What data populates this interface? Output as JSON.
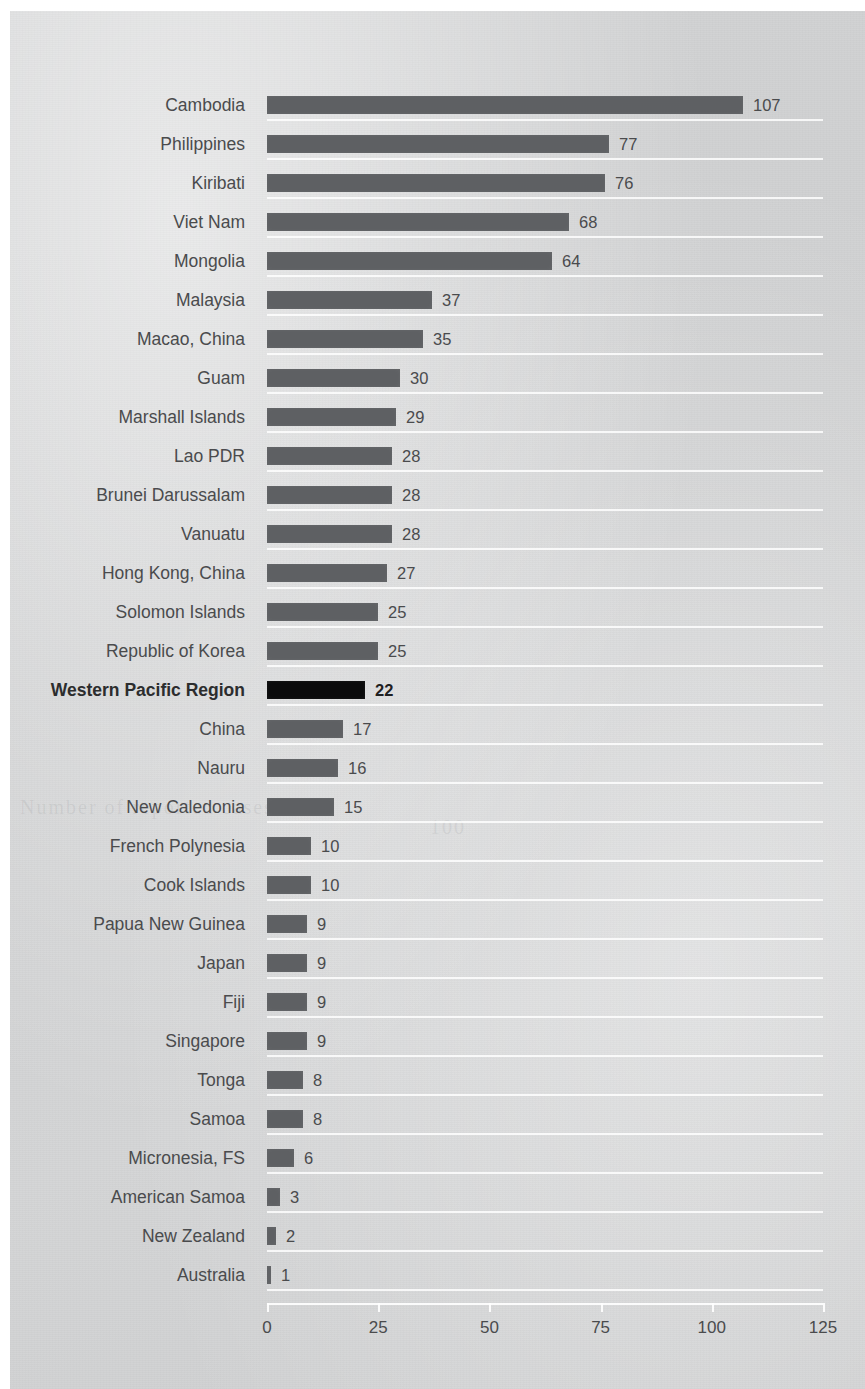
{
  "chart_data": {
    "type": "bar",
    "orientation": "horizontal",
    "title": "",
    "xlabel": "",
    "ylabel": "",
    "xlim": [
      0,
      125
    ],
    "xticks": [
      "0",
      "25",
      "50",
      "75",
      "100",
      "125"
    ],
    "grid": true,
    "legend": "none",
    "highlight_category": "Western Pacific Region",
    "colors": {
      "bar": "#5e6063",
      "highlight_bar": "#0b0b0c",
      "gridline": "#ffffff",
      "text": "#4a4b4d",
      "page_background": "#d2d3d4"
    },
    "categories": [
      "Cambodia",
      "Philippines",
      "Kiribati",
      "Viet Nam",
      "Mongolia",
      "Malaysia",
      "Macao, China",
      "Guam",
      "Marshall Islands",
      "Lao PDR",
      "Brunei Darussalam",
      "Vanuatu",
      "Hong Kong, China",
      "Solomon Islands",
      "Republic of Korea",
      "Western Pacific Region",
      "China",
      "Nauru",
      "New Caledonia",
      "French Polynesia",
      "Cook Islands",
      "Papua New Guinea",
      "Japan",
      "Fiji",
      "Singapore",
      "Tonga",
      "Samoa",
      "Micronesia, FS",
      "American Samoa",
      "New Zealand",
      "Australia"
    ],
    "values": [
      107,
      77,
      76,
      68,
      64,
      37,
      35,
      30,
      29,
      28,
      28,
      28,
      27,
      25,
      25,
      22,
      17,
      16,
      15,
      10,
      10,
      9,
      9,
      9,
      9,
      8,
      8,
      6,
      3,
      2,
      1
    ],
    "value_labels": [
      "107",
      "77",
      "76",
      "68",
      "64",
      "37",
      "35",
      "30",
      "29",
      "28",
      "28",
      "28",
      "27",
      "25",
      "25",
      "22",
      "17",
      "16",
      "15",
      "10",
      "10",
      "9",
      "9",
      "9",
      "9",
      "8",
      "8",
      "6",
      "3",
      "2",
      "1"
    ]
  },
  "ghost_text": {
    "line1": "Number of reported cases",
    "line2": "100"
  }
}
